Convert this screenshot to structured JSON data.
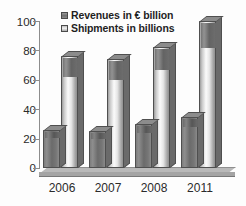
{
  "chart_data": {
    "type": "bar",
    "title": "",
    "subtitle": "",
    "xlabel": "",
    "ylabel": "",
    "categories": [
      "2006",
      "2007",
      "2008",
      "2011"
    ],
    "series": [
      {
        "name": "Revenues in € billion",
        "values": [
          26,
          25,
          30,
          35
        ],
        "color": "#6e6e6e"
      },
      {
        "name": "Shipments in billions",
        "values": [
          76,
          74,
          82,
          100
        ],
        "color": "#e0e0e0"
      }
    ],
    "ylim": [
      0,
      100
    ],
    "yticks": [
      0,
      20,
      40,
      60,
      80,
      100
    ],
    "ytick_labels": [
      "0",
      "20",
      "40",
      "60",
      "80",
      "100"
    ],
    "grid": false,
    "legend_position": "top-center",
    "style": "3d-column"
  },
  "legend": {
    "entries": [
      {
        "label": "Revenues in € billion",
        "swatch": "rev"
      },
      {
        "label": "Shipments in billions",
        "swatch": "shp"
      }
    ]
  },
  "axes": {
    "y_tick_labels": [
      "100",
      "80",
      "60",
      "40",
      "20",
      "0"
    ],
    "x_tick_labels": [
      "2006",
      "2007",
      "2008",
      "2011"
    ]
  }
}
